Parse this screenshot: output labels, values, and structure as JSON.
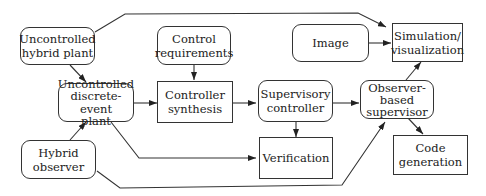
{
  "diagram": {
    "nodes": {
      "uncontrolled_hybrid_plant": "Uncontrolled\nhybrid plant",
      "control_requirements": "Control\nrequirements",
      "image": "Image",
      "simulation_visualization": "Simulation/\nvisualization",
      "uncontrolled_des_plant": "Uncontrolled\ndiscrete-event\nplant",
      "controller_synthesis": "Controller\nsynthesis",
      "supervisory_controller": "Supervisory\ncontroller",
      "observer_based_supervisor": "Observer-\nbased\nsupervisor",
      "hybrid_observer": "Hybrid\nobserver",
      "verification": "Verification",
      "code_generation": "Code\ngeneration"
    },
    "edges": [
      {
        "from": "Uncontrolled hybrid plant",
        "to": "Simulation/visualization"
      },
      {
        "from": "Uncontrolled hybrid plant",
        "to": "Uncontrolled discrete-event plant"
      },
      {
        "from": "Control requirements",
        "to": "Controller synthesis"
      },
      {
        "from": "Image",
        "to": "Simulation/visualization"
      },
      {
        "from": "Uncontrolled discrete-event plant",
        "to": "Controller synthesis"
      },
      {
        "from": "Uncontrolled discrete-event plant",
        "to": "Verification"
      },
      {
        "from": "Controller synthesis",
        "to": "Supervisory controller"
      },
      {
        "from": "Supervisory controller",
        "to": "Observer-based supervisor"
      },
      {
        "from": "Supervisory controller",
        "to": "Verification"
      },
      {
        "from": "Observer-based supervisor",
        "to": "Simulation/visualization"
      },
      {
        "from": "Observer-based supervisor",
        "to": "Code generation"
      },
      {
        "from": "Hybrid observer",
        "to": "Uncontrolled discrete-event plant"
      },
      {
        "from": "Hybrid observer",
        "to": "Observer-based supervisor"
      }
    ]
  }
}
